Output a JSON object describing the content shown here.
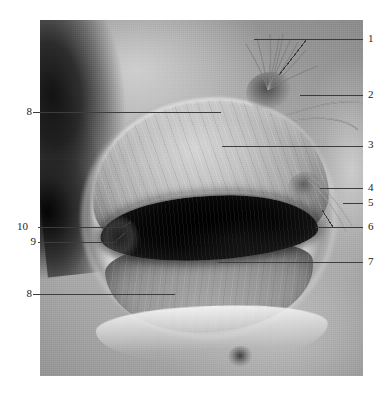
{
  "figure": {
    "media_type": "grayscale-photograph",
    "background_color": "#ffffff",
    "leader_line_color": "#3c3c3c",
    "photo": {
      "x": 40,
      "y": 20,
      "width": 323,
      "height": 356,
      "description": "Grayscale surgical/anatomical dissection showing an ovoid opening with a pale dome-shaped structure above a dark elongated cavity, suture threads at upper right, dark shadow at left margin"
    }
  },
  "labels": [
    {
      "id": "1",
      "text": "1",
      "side": "right",
      "text_x": 368,
      "text_y": 33,
      "line": [
        [
          254,
          39
        ],
        [
          363,
          39
        ]
      ],
      "branch": [
        [
          307,
          39
        ],
        [
          279,
          75
        ]
      ]
    },
    {
      "id": "2",
      "text": "2",
      "side": "right",
      "text_x": 368,
      "text_y": 89,
      "line": [
        [
          300,
          95
        ],
        [
          363,
          95
        ]
      ]
    },
    {
      "id": "3",
      "text": "3",
      "side": "right",
      "text_x": 368,
      "text_y": 139,
      "line": [
        [
          222,
          146
        ],
        [
          363,
          146
        ]
      ]
    },
    {
      "id": "4",
      "text": "4",
      "side": "right",
      "text_x": 368,
      "text_y": 182,
      "line": [
        [
          320,
          188
        ],
        [
          363,
          188
        ]
      ]
    },
    {
      "id": "5",
      "text": "5",
      "side": "right",
      "text_x": 368,
      "text_y": 197,
      "line": [
        [
          343,
          203
        ],
        [
          363,
          203
        ]
      ]
    },
    {
      "id": "6",
      "text": "6",
      "side": "right",
      "text_x": 368,
      "text_y": 221,
      "line": [
        [
          316,
          227
        ],
        [
          363,
          227
        ]
      ],
      "branch": [
        [
          333,
          227
        ],
        [
          322,
          210
        ]
      ]
    },
    {
      "id": "7",
      "text": "7",
      "side": "right",
      "text_x": 368,
      "text_y": 256,
      "line": [
        [
          218,
          262
        ],
        [
          363,
          262
        ]
      ]
    },
    {
      "id": "8a",
      "text": "8",
      "side": "left",
      "text_x": 18,
      "text_y": 106,
      "line": [
        [
          33,
          112
        ],
        [
          221,
          112
        ]
      ]
    },
    {
      "id": "10",
      "text": "10",
      "side": "left",
      "text_x": 14,
      "text_y": 221,
      "line": [
        [
          38,
          227
        ],
        [
          123,
          227
        ]
      ],
      "branch": [
        [
          123,
          227
        ],
        [
          131,
          222
        ]
      ]
    },
    {
      "id": "9",
      "text": "9",
      "side": "left",
      "text_x": 22,
      "text_y": 236,
      "line": [
        [
          38,
          242
        ],
        [
          115,
          242
        ]
      ],
      "branch": [
        [
          115,
          242
        ],
        [
          128,
          230
        ]
      ]
    },
    {
      "id": "8b",
      "text": "8",
      "side": "left",
      "text_x": 18,
      "text_y": 288,
      "line": [
        [
          33,
          294
        ],
        [
          175,
          294
        ]
      ]
    }
  ],
  "threads": {
    "name": "suture-threads",
    "count": 9,
    "origin": {
      "x": 228,
      "y": 70
    },
    "paths": [
      "M228,70 C232,52 236,36 239,18",
      "M228,70 C235,54 243,38 250,20",
      "M228,70 C238,55 249,40 258,22",
      "M228,70 C240,58 254,45 266,30",
      "M228,70 C236,50 240,32 243,14",
      "M228,70 C231,48 231,30 230,14",
      "M228,70 C225,50 221,34 217,18",
      "M228,70 C222,52 214,38 206,24",
      "M228,70 C245,60 262,52 278,46"
    ],
    "curved_right_paths": [
      "M247,95 C275,86 298,80 318,82 C334,84 340,96 336,112",
      "M253,100 C282,96 305,98 318,110"
    ],
    "lower_right_paths": [
      "M268,160 C282,172 296,190 306,212",
      "M272,158 C288,170 300,186 312,206"
    ]
  }
}
